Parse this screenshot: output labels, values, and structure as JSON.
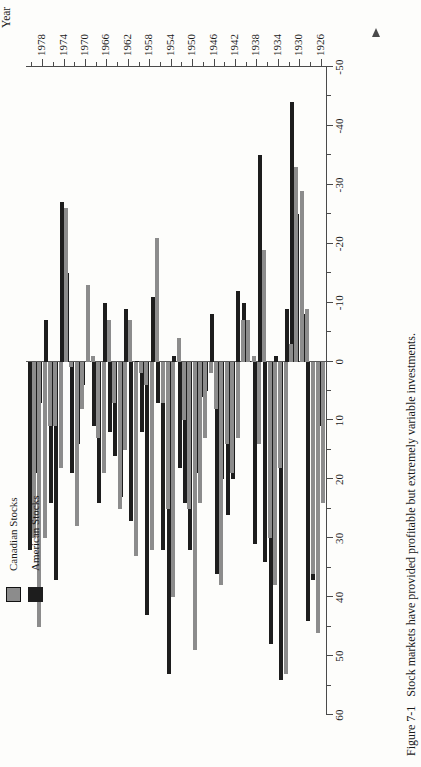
{
  "figure": {
    "number": "Figure 7-1",
    "caption": "Stock markets have provided profitable but extremely variable investments."
  },
  "legend": {
    "position": "top-left",
    "items": [
      {
        "label": "Canadian Stocks",
        "color": "#8c8c8c",
        "key": "canadian"
      },
      {
        "label": "American Stocks",
        "color": "#1d1d1d",
        "key": "american"
      }
    ]
  },
  "axes": {
    "value_axis_title_line1": "Rate of return,",
    "value_axis_title_line2": "percent",
    "value_axis_labels": [
      "60",
      "50",
      "40",
      "30",
      "20",
      "10",
      "0",
      "-10",
      "-20",
      "-30",
      "-40",
      "-50"
    ],
    "value_axis_min": -50,
    "value_axis_max": 60,
    "value_tick_step": 5,
    "year_axis_title": "Year",
    "year_axis_labels": [
      "1926",
      "1930",
      "1934",
      "1938",
      "1942",
      "1946",
      "1950",
      "1954",
      "1958",
      "1962",
      "1966",
      "1970",
      "1974",
      "1978"
    ],
    "year_min": 1925,
    "year_max": 1981
  },
  "chart_data": {
    "type": "bar",
    "orientation": "horizontal-rotated",
    "title": "Stock markets have provided profitable but extremely variable investments.",
    "xlabel": "Rate of return, percent",
    "ylabel": "Year",
    "ylim": [
      -50,
      60
    ],
    "grid": false,
    "legend_position": "top-left",
    "categories": [
      1926,
      1927,
      1928,
      1929,
      1930,
      1931,
      1932,
      1933,
      1934,
      1935,
      1936,
      1937,
      1938,
      1939,
      1940,
      1941,
      1942,
      1943,
      1944,
      1945,
      1946,
      1947,
      1948,
      1949,
      1950,
      1951,
      1952,
      1953,
      1954,
      1955,
      1956,
      1957,
      1958,
      1959,
      1960,
      1961,
      1962,
      1963,
      1964,
      1965,
      1966,
      1967,
      1968,
      1969,
      1970,
      1971,
      1972,
      1973,
      1974,
      1975,
      1976,
      1977,
      1978,
      1979,
      1980
    ],
    "series": [
      {
        "name": "Canadian Stocks",
        "color": "#8c8c8c",
        "values": [
          24,
          46,
          36,
          -9,
          -29,
          -33,
          -3,
          53,
          18,
          38,
          30,
          -19,
          14,
          -1,
          -7,
          -7,
          13,
          19,
          14,
          38,
          8,
          2,
          13,
          24,
          49,
          25,
          10,
          -4,
          40,
          25,
          7,
          -21,
          32,
          4,
          2,
          33,
          -7,
          15,
          25,
          7,
          -7,
          19,
          13,
          -1,
          -13,
          8,
          28,
          1,
          -26,
          18,
          11,
          11,
          30,
          45,
          30
        ]
      },
      {
        "name": "American Stocks",
        "color": "#1d1d1d",
        "values": [
          11,
          37,
          44,
          -8,
          -25,
          -44,
          -9,
          54,
          -1,
          48,
          34,
          -35,
          31,
          0,
          -10,
          -12,
          20,
          26,
          20,
          36,
          -8,
          5,
          6,
          19,
          32,
          24,
          18,
          -1,
          53,
          32,
          7,
          -11,
          43,
          12,
          0,
          27,
          -9,
          23,
          16,
          12,
          -10,
          24,
          11,
          -8,
          4,
          14,
          19,
          -15,
          -27,
          37,
          24,
          -7,
          7,
          19,
          32
        ]
      }
    ]
  }
}
